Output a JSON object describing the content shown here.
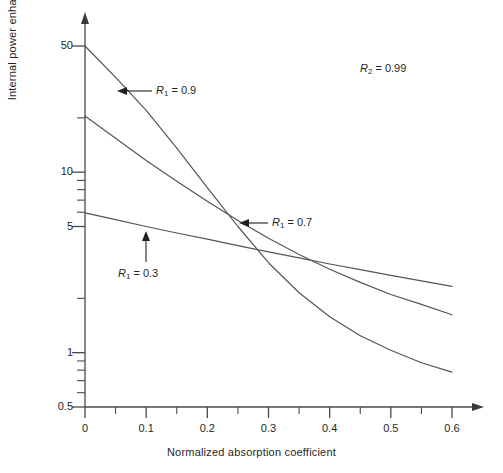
{
  "chart_data": {
    "type": "line",
    "title": "",
    "xlabel": "Normalized absorption coefficient",
    "ylabel": "Internal power enhancement factor",
    "yscale": "log",
    "xlim": [
      0,
      0.6
    ],
    "ylim": [
      0.5,
      60
    ],
    "grid": false,
    "legend": "inline-annotations",
    "xticks": [
      "0",
      "0.1",
      "0.2",
      "0.3",
      "0.4",
      "0.5",
      "0.6"
    ],
    "xtick_values": [
      0,
      0.1,
      0.2,
      0.3,
      0.4,
      0.5,
      0.6
    ],
    "xminor_step": 0.05,
    "yticks": [
      "50",
      "10",
      "5",
      "1",
      "0.5"
    ],
    "ytick_values": [
      50,
      10,
      5,
      1,
      0.5
    ],
    "yminor_values": [
      20,
      9,
      8,
      7,
      6,
      2,
      0.9,
      0.8,
      0.7,
      0.6
    ],
    "annotations": [
      {
        "text": "R2 = 0.99",
        "symbol": "R",
        "sub": "2",
        "value": "0.99",
        "x": 0.42,
        "y": 30
      },
      {
        "text": "R1 = 0.9",
        "symbol": "R",
        "sub": "1",
        "value": "0.9",
        "x": 0.115,
        "y": 26
      },
      {
        "text": "R1 = 0.7",
        "symbol": "R",
        "sub": "1",
        "value": "0.7",
        "x": 0.27,
        "y": 5.2
      },
      {
        "text": "R1 = 0.3",
        "symbol": "R",
        "sub": "1",
        "value": "0.3",
        "x": 0.065,
        "y": 2.9
      }
    ],
    "series": [
      {
        "name": "R1 = 0.9",
        "x": [
          0,
          0.05,
          0.1,
          0.15,
          0.2,
          0.25,
          0.3,
          0.35,
          0.4,
          0.45,
          0.5,
          0.55,
          0.6
        ],
        "values": [
          50,
          33.5,
          22.0,
          13.6,
          8.2,
          5.0,
          3.15,
          2.15,
          1.58,
          1.24,
          1.03,
          0.88,
          0.78
        ]
      },
      {
        "name": "R1 = 0.7",
        "x": [
          0,
          0.05,
          0.1,
          0.15,
          0.2,
          0.25,
          0.3,
          0.35,
          0.4,
          0.45,
          0.5,
          0.55,
          0.6
        ],
        "values": [
          20.5,
          15.4,
          11.6,
          8.9,
          6.9,
          5.4,
          4.3,
          3.5,
          2.9,
          2.45,
          2.1,
          1.85,
          1.62
        ]
      },
      {
        "name": "R1 = 0.3",
        "x": [
          0,
          0.05,
          0.1,
          0.15,
          0.2,
          0.25,
          0.3,
          0.35,
          0.4,
          0.45,
          0.5,
          0.55,
          0.6
        ],
        "values": [
          5.95,
          5.45,
          5.0,
          4.6,
          4.25,
          3.92,
          3.62,
          3.35,
          3.1,
          2.88,
          2.68,
          2.5,
          2.33
        ]
      }
    ]
  },
  "axes": {
    "x_title": "Normalized absorption coefficient",
    "y_title": "Internal power enhancement factor"
  },
  "tick_labels": {
    "y": [
      "50",
      "10",
      "5",
      "1",
      "0.5"
    ],
    "x": [
      "0",
      "0.1",
      "0.2",
      "0.3",
      "0.4",
      "0.5",
      "0.6"
    ]
  },
  "colors": {
    "line": "#555555",
    "axis": "#4a4a4a",
    "text": "#1f1f1f",
    "background": "#ffffff"
  }
}
